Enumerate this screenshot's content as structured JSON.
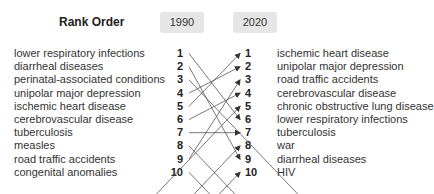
{
  "title": "Rank Order",
  "years": {
    "left": "1990",
    "right": "2020"
  },
  "left": [
    {
      "rank": "1",
      "label": "lower respiratory infections"
    },
    {
      "rank": "2",
      "label": "diarrheal diseases"
    },
    {
      "rank": "3",
      "label": "perinatal-associated conditions"
    },
    {
      "rank": "4",
      "label": "unipolar major depression"
    },
    {
      "rank": "5",
      "label": "ischemic heart disease"
    },
    {
      "rank": "6",
      "label": "cerebrovascular disease"
    },
    {
      "rank": "7",
      "label": "tuberculosis"
    },
    {
      "rank": "8",
      "label": "measles"
    },
    {
      "rank": "9",
      "label": "road traffic accidents"
    },
    {
      "rank": "10",
      "label": "congenital anomalies"
    }
  ],
  "right": [
    {
      "rank": "1",
      "label": "ischemic heart disease"
    },
    {
      "rank": "2",
      "label": "unipolar major depression"
    },
    {
      "rank": "3",
      "label": "road traffic accidents"
    },
    {
      "rank": "4",
      "label": "cerebrovascular disease"
    },
    {
      "rank": "5",
      "label": "chronic obstructive lung disease"
    },
    {
      "rank": "6",
      "label": "lower respiratory infections"
    },
    {
      "rank": "7",
      "label": "tuberculosis"
    },
    {
      "rank": "8",
      "label": "war"
    },
    {
      "rank": "9",
      "label": "diarrheal diseases"
    },
    {
      "rank": "10",
      "label": "HIV"
    }
  ],
  "connections": [
    {
      "from": 1,
      "to": 6
    },
    {
      "from": 2,
      "to": 9
    },
    {
      "from": 3,
      "to": null
    },
    {
      "from": 4,
      "to": 2
    },
    {
      "from": 5,
      "to": 1
    },
    {
      "from": 6,
      "to": 4
    },
    {
      "from": 7,
      "to": 7
    },
    {
      "from": 8,
      "to": null
    },
    {
      "from": 9,
      "to": 3
    },
    {
      "from": 10,
      "to": null
    },
    {
      "from": null,
      "to": 5
    },
    {
      "from": null,
      "to": 8
    },
    {
      "from": null,
      "to": 10
    }
  ],
  "colors": {
    "badge_bg": "#e6e6e6",
    "line": "#555555",
    "text": "#333333"
  }
}
